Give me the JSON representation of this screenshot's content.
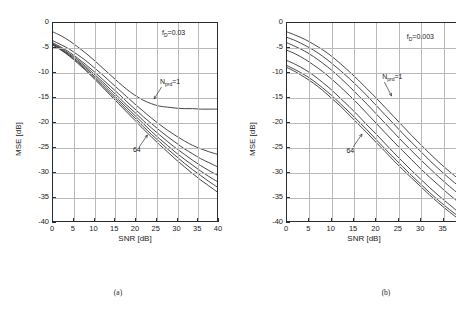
{
  "figure": {
    "panel_a_caption": "(a)",
    "panel_b_caption": "(b)"
  },
  "panel_a": {
    "fd_label_prefix": "f",
    "fd_label_sub": "D",
    "fd_label_value": "=0.03",
    "nprd_prefix": "N",
    "nprd_sub": "prd",
    "nprd_value": "=1",
    "n64_label": "64"
  },
  "panel_b": {
    "fd_label_prefix": "f",
    "fd_label_sub": "D",
    "fd_label_value": "=0.003",
    "nprd_prefix": "N",
    "nprd_sub": "prd",
    "nprd_value": "=1",
    "n64_label": "64"
  },
  "chart_data": [
    {
      "type": "line",
      "panel": "a",
      "title": "",
      "xlabel": "SNR [dB]",
      "ylabel": "MSE [dB]",
      "xlim": [
        0,
        40
      ],
      "ylim": [
        -40,
        0
      ],
      "xticks": [
        0,
        5,
        10,
        15,
        20,
        25,
        30,
        35,
        40
      ],
      "yticks": [
        0,
        -5,
        -10,
        -15,
        -20,
        -25,
        -30,
        -35,
        -40
      ],
      "xticklabels": [
        "0",
        "5",
        "10",
        "15",
        "20",
        "25",
        "30",
        "35",
        "40"
      ],
      "yticklabels": [
        "0",
        "-5",
        "-10",
        "-15",
        "-20",
        "-25",
        "-30",
        "-35",
        "-40"
      ],
      "grid": true,
      "legend": false,
      "annotations": [
        {
          "text": "f_D=0.03",
          "x": 27.5,
          "y": -3.0
        },
        {
          "text": "N_prd=1",
          "x": 27.0,
          "y": -12.5
        },
        {
          "text": "64",
          "x": 21.0,
          "y": -26.0
        }
      ],
      "x": [
        0,
        2,
        4,
        6,
        8,
        10,
        12,
        14,
        16,
        18,
        20,
        22,
        24,
        26,
        28,
        30,
        32,
        34,
        36,
        38,
        40
      ],
      "series": [
        {
          "name": "N_prd=1",
          "values": [
            -1.8,
            -2.6,
            -3.6,
            -4.8,
            -6.1,
            -7.5,
            -9.0,
            -10.5,
            -12.0,
            -13.4,
            -14.6,
            -15.6,
            -16.3,
            -16.8,
            -17.0,
            -17.2,
            -17.3,
            -17.3,
            -17.4,
            -17.4,
            -17.4
          ]
        },
        {
          "name": "N_prd=2",
          "values": [
            -3.6,
            -4.4,
            -5.3,
            -6.4,
            -7.6,
            -9.0,
            -10.4,
            -11.9,
            -13.4,
            -14.9,
            -16.4,
            -17.8,
            -19.2,
            -20.5,
            -21.7,
            -22.8,
            -23.8,
            -24.7,
            -25.4,
            -26.0,
            -26.5
          ]
        },
        {
          "name": "N_prd=4",
          "values": [
            -4.0,
            -4.9,
            -5.9,
            -7.1,
            -8.4,
            -9.8,
            -11.3,
            -12.8,
            -14.3,
            -15.9,
            -17.4,
            -18.9,
            -20.3,
            -21.7,
            -23.0,
            -24.2,
            -25.4,
            -26.4,
            -27.4,
            -28.2,
            -29.0
          ]
        },
        {
          "name": "N_prd=8",
          "values": [
            -4.2,
            -5.1,
            -6.2,
            -7.4,
            -8.8,
            -10.3,
            -11.8,
            -13.4,
            -15.0,
            -16.6,
            -18.1,
            -19.7,
            -21.2,
            -22.6,
            -24.0,
            -25.3,
            -26.5,
            -27.7,
            -28.8,
            -29.8,
            -30.7
          ]
        },
        {
          "name": "N_prd=16",
          "values": [
            -4.3,
            -5.3,
            -6.4,
            -7.7,
            -9.1,
            -10.7,
            -12.2,
            -13.9,
            -15.5,
            -17.1,
            -18.7,
            -20.3,
            -21.9,
            -23.4,
            -24.8,
            -26.2,
            -27.5,
            -28.7,
            -29.9,
            -31.0,
            -32.0
          ]
        },
        {
          "name": "N_prd=32",
          "values": [
            -4.4,
            -5.4,
            -6.6,
            -7.9,
            -9.4,
            -11.0,
            -12.6,
            -14.3,
            -15.9,
            -17.6,
            -19.2,
            -20.9,
            -22.5,
            -24.0,
            -25.5,
            -26.9,
            -28.3,
            -29.6,
            -30.8,
            -32.0,
            -33.1
          ]
        },
        {
          "name": "N_prd=64",
          "values": [
            -4.5,
            -5.5,
            -6.7,
            -8.1,
            -9.6,
            -11.2,
            -12.9,
            -14.6,
            -16.3,
            -18.0,
            -19.7,
            -21.4,
            -23.0,
            -24.6,
            -26.1,
            -27.6,
            -29.0,
            -30.4,
            -31.7,
            -32.9,
            -34.1
          ]
        }
      ]
    },
    {
      "type": "line",
      "panel": "b",
      "title": "",
      "xlabel": "SNR [dB]",
      "ylabel": "MSE [dB]",
      "xlim": [
        0,
        38
      ],
      "ylim": [
        -40,
        0
      ],
      "xticks": [
        0,
        5,
        10,
        15,
        20,
        25,
        30,
        35
      ],
      "yticks": [
        0,
        -5,
        -10,
        -15,
        -20,
        -25,
        -30,
        -35,
        -40
      ],
      "xticklabels": [
        "0",
        "5",
        "10",
        "15",
        "20",
        "25",
        "30",
        "35"
      ],
      "yticklabels": [
        "0",
        "-5",
        "-10",
        "-15",
        "-20",
        "-25",
        "-30",
        "-35",
        "-40"
      ],
      "grid": true,
      "legend": false,
      "annotations": [
        {
          "text": "f_D=0.003",
          "x": 27.0,
          "y": -3.5
        },
        {
          "text": "N_prd=1",
          "x": 22.0,
          "y": -11.5
        },
        {
          "text": "64",
          "x": 15.0,
          "y": -26.0
        }
      ],
      "x": [
        0,
        2,
        4,
        6,
        8,
        10,
        12,
        14,
        16,
        18,
        20,
        22,
        24,
        26,
        28,
        30,
        32,
        34,
        36,
        38
      ],
      "series": [
        {
          "name": "N_prd=1",
          "values": [
            -1.8,
            -2.5,
            -3.3,
            -4.3,
            -5.4,
            -6.7,
            -8.2,
            -9.8,
            -11.5,
            -13.3,
            -15.1,
            -17.0,
            -18.9,
            -20.8,
            -22.7,
            -24.5,
            -26.3,
            -28.0,
            -29.6,
            -31.1
          ]
        },
        {
          "name": "N_prd=2",
          "values": [
            -2.9,
            -3.6,
            -4.5,
            -5.5,
            -6.7,
            -8.1,
            -9.6,
            -11.2,
            -12.9,
            -14.7,
            -16.6,
            -18.5,
            -20.4,
            -22.3,
            -24.1,
            -25.9,
            -27.7,
            -29.4,
            -31.0,
            -32.5
          ]
        },
        {
          "name": "N_prd=4",
          "values": [
            -4.0,
            -4.8,
            -5.7,
            -6.8,
            -8.1,
            -9.5,
            -11.1,
            -12.8,
            -14.6,
            -16.4,
            -18.3,
            -20.2,
            -22.1,
            -24.0,
            -25.8,
            -27.6,
            -29.3,
            -31.0,
            -32.6,
            -34.1
          ]
        },
        {
          "name": "N_prd=8",
          "values": [
            -5.5,
            -6.3,
            -7.3,
            -8.5,
            -9.8,
            -11.3,
            -12.9,
            -14.6,
            -16.4,
            -18.3,
            -20.2,
            -22.1,
            -24.0,
            -25.8,
            -27.6,
            -29.4,
            -31.1,
            -32.7,
            -34.3,
            -35.8
          ]
        },
        {
          "name": "N_prd=16",
          "values": [
            -7.6,
            -8.4,
            -9.4,
            -10.6,
            -12.0,
            -13.5,
            -15.2,
            -16.9,
            -18.7,
            -20.6,
            -22.4,
            -24.3,
            -26.2,
            -28.0,
            -29.8,
            -31.5,
            -33.2,
            -34.8,
            -36.3,
            -37.8
          ]
        },
        {
          "name": "N_prd=32",
          "values": [
            -8.6,
            -9.5,
            -10.5,
            -11.7,
            -13.1,
            -14.6,
            -16.3,
            -18.0,
            -19.8,
            -21.6,
            -23.5,
            -25.4,
            -27.2,
            -29.0,
            -30.8,
            -32.5,
            -34.2,
            -35.8,
            -37.3,
            -38.7
          ]
        },
        {
          "name": "N_prd=64",
          "values": [
            -9.0,
            -9.9,
            -11.0,
            -12.2,
            -13.6,
            -15.2,
            -16.8,
            -18.6,
            -20.4,
            -22.2,
            -24.1,
            -25.9,
            -27.8,
            -29.6,
            -31.3,
            -33.0,
            -34.7,
            -36.3,
            -37.8,
            -39.2
          ]
        }
      ]
    }
  ]
}
